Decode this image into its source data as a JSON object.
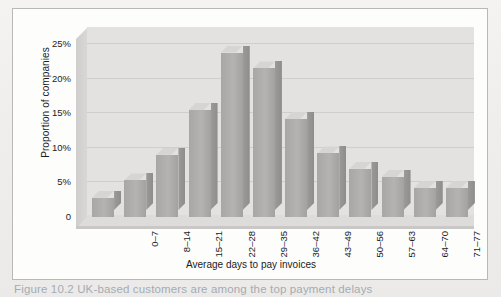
{
  "chart_data": {
    "type": "bar",
    "title": "",
    "xlabel": "Average days to pay invoices",
    "ylabel": "Proportion of companies",
    "categories": [
      "0–7",
      "8–14",
      "15–21",
      "22–28",
      "29–35",
      "36–42",
      "43–49",
      "50–56",
      "57–63",
      "64–70",
      "71–77",
      "78+"
    ],
    "values": [
      2.8,
      5.3,
      9.0,
      15.5,
      23.8,
      21.5,
      14.2,
      9.2,
      7.0,
      5.8,
      4.2,
      4.2
    ],
    "ylim": [
      0,
      27.5
    ],
    "ytick_labels": [
      "25%",
      "20%",
      "15%",
      "10%",
      "5%",
      "0"
    ],
    "ytick_values": [
      25,
      20,
      15,
      10,
      5,
      0
    ],
    "grid": true,
    "legend": false,
    "style": "3d-bars",
    "bar_color": "#b4b3b1",
    "plot_background": "#e3e2e0",
    "gridline_color": "#cfcecc"
  },
  "figure": {
    "caption": "Figure 10.2  UK-based customers are among the top payment delays",
    "frame_color": "#b9b8b6",
    "page_background": "#f2f1ef"
  }
}
